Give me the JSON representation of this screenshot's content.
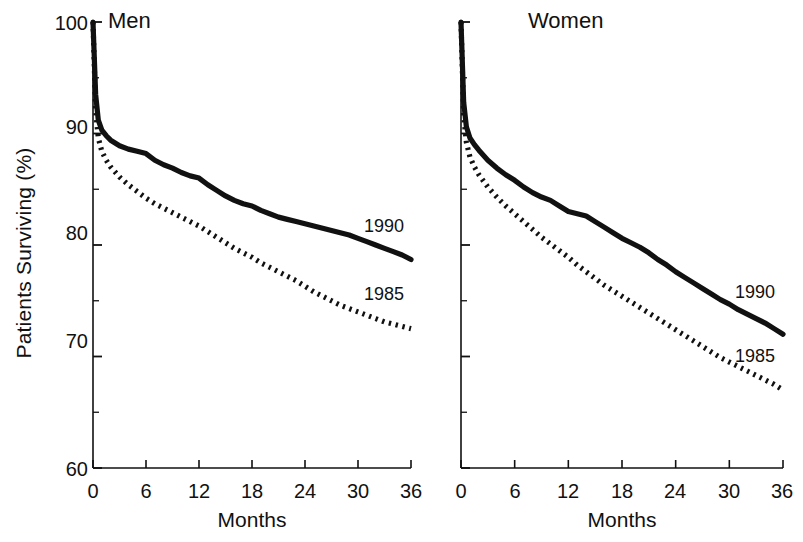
{
  "figure": {
    "ylabel": "Patients Surviving (%)",
    "panels": [
      {
        "key": "men",
        "title": "Men",
        "xlabel": "Months",
        "series_labels": {
          "solid": "1990",
          "dotted": "1985"
        }
      },
      {
        "key": "women",
        "title": "Women",
        "xlabel": "Months",
        "series_labels": {
          "solid": "1990",
          "dotted": "1985"
        }
      }
    ],
    "yticks": [
      "100",
      "90",
      "80",
      "70",
      "60"
    ],
    "xticks": [
      "0",
      "6",
      "12",
      "18",
      "24",
      "30",
      "36"
    ],
    "colors": {
      "ink": "#111111",
      "background": "#ffffff"
    }
  },
  "chart_data": [
    {
      "type": "line",
      "title": "Men",
      "xlabel": "Months",
      "ylabel": "Patients Surviving (%)",
      "xlim": [
        0,
        36
      ],
      "ylim": [
        60,
        100
      ],
      "xticks": [
        0,
        6,
        12,
        18,
        24,
        30,
        36
      ],
      "yticks": [
        60,
        70,
        80,
        90,
        100
      ],
      "minor_ytick_interval": 5,
      "grid": false,
      "legend": "inline-annotation",
      "series": [
        {
          "name": "1990",
          "style": "solid",
          "x": [
            0,
            0.3,
            0.6,
            1,
            1.5,
            2,
            3,
            4,
            5,
            6,
            7,
            8,
            9,
            10,
            11,
            12,
            13,
            14,
            15,
            16,
            17,
            18,
            19,
            20,
            21,
            22,
            23,
            24,
            25,
            26,
            27,
            28,
            29,
            30,
            31,
            32,
            33,
            34,
            35,
            36
          ],
          "y": [
            100,
            93.5,
            91.2,
            90.3,
            89.8,
            89.4,
            88.9,
            88.6,
            88.4,
            88.2,
            87.6,
            87.2,
            86.9,
            86.5,
            86.2,
            86.0,
            85.4,
            84.9,
            84.4,
            84.0,
            83.7,
            83.5,
            83.1,
            82.8,
            82.5,
            82.3,
            82.1,
            81.9,
            81.7,
            81.5,
            81.3,
            81.1,
            80.9,
            80.6,
            80.3,
            80.0,
            79.7,
            79.4,
            79.1,
            78.7
          ]
        },
        {
          "name": "1985",
          "style": "dotted",
          "x": [
            0,
            0.3,
            0.6,
            1,
            1.5,
            2,
            3,
            4,
            5,
            6,
            7,
            8,
            9,
            10,
            11,
            12,
            13,
            14,
            15,
            16,
            17,
            18,
            19,
            20,
            21,
            22,
            23,
            24,
            25,
            26,
            27,
            28,
            29,
            30,
            31,
            32,
            33,
            34,
            35,
            36
          ],
          "y": [
            100,
            92.0,
            89.6,
            88.4,
            87.6,
            87.0,
            86.1,
            85.4,
            84.8,
            84.2,
            83.7,
            83.3,
            82.9,
            82.5,
            82.1,
            81.7,
            81.2,
            80.7,
            80.2,
            79.7,
            79.3,
            78.9,
            78.4,
            78.0,
            77.6,
            77.2,
            76.8,
            76.3,
            75.8,
            75.4,
            75.0,
            74.6,
            74.3,
            74.0,
            73.7,
            73.4,
            73.1,
            72.9,
            72.7,
            72.5
          ]
        }
      ]
    },
    {
      "type": "line",
      "title": "Women",
      "xlabel": "Months",
      "ylabel": "Patients Surviving (%)",
      "xlim": [
        0,
        36
      ],
      "ylim": [
        60,
        100
      ],
      "xticks": [
        0,
        6,
        12,
        18,
        24,
        30,
        36
      ],
      "yticks": [
        60,
        70,
        80,
        90,
        100
      ],
      "minor_ytick_interval": 5,
      "grid": false,
      "legend": "inline-annotation",
      "series": [
        {
          "name": "1990",
          "style": "solid",
          "x": [
            0,
            0.3,
            0.6,
            1,
            1.5,
            2,
            3,
            4,
            5,
            6,
            7,
            8,
            9,
            10,
            11,
            12,
            13,
            14,
            15,
            16,
            17,
            18,
            19,
            20,
            21,
            22,
            23,
            24,
            25,
            26,
            27,
            28,
            29,
            30,
            31,
            32,
            33,
            34,
            35,
            36
          ],
          "y": [
            100,
            92.8,
            90.6,
            89.6,
            89.0,
            88.5,
            87.6,
            86.9,
            86.3,
            85.8,
            85.2,
            84.7,
            84.3,
            84.0,
            83.5,
            83.0,
            82.8,
            82.6,
            82.1,
            81.6,
            81.1,
            80.6,
            80.2,
            79.8,
            79.3,
            78.7,
            78.2,
            77.6,
            77.1,
            76.6,
            76.1,
            75.6,
            75.1,
            74.7,
            74.2,
            73.8,
            73.4,
            73.0,
            72.5,
            72.0
          ]
        },
        {
          "name": "1985",
          "style": "dotted",
          "x": [
            0,
            0.3,
            0.6,
            1,
            1.5,
            2,
            3,
            4,
            5,
            6,
            7,
            8,
            9,
            10,
            11,
            12,
            13,
            14,
            15,
            16,
            17,
            18,
            19,
            20,
            21,
            22,
            23,
            24,
            25,
            26,
            27,
            28,
            29,
            30,
            31,
            32,
            33,
            34,
            35,
            36
          ],
          "y": [
            100,
            91.6,
            89.2,
            87.9,
            87.0,
            86.3,
            85.2,
            84.3,
            83.5,
            82.8,
            82.1,
            81.4,
            80.7,
            80.1,
            79.5,
            78.9,
            78.2,
            77.6,
            77.0,
            76.4,
            75.9,
            75.4,
            74.9,
            74.4,
            73.9,
            73.4,
            72.9,
            72.4,
            71.9,
            71.4,
            70.9,
            70.4,
            69.9,
            69.5,
            69.1,
            68.7,
            68.3,
            67.9,
            67.5,
            67.0
          ]
        }
      ]
    }
  ]
}
